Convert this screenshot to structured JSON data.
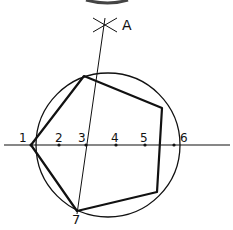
{
  "diagram": {
    "circle": {
      "cx": 108,
      "cy": 145,
      "r": 72
    },
    "baseline": {
      "x1": 4,
      "y1": 145,
      "x2": 230,
      "y2": 145
    },
    "construction_line": {
      "x1": 105,
      "y1": 18,
      "x2": 77,
      "y2": 214
    },
    "arc_mark_A": {
      "x": 105,
      "y": 25
    },
    "pentagon_vertices": [
      [
        31,
        145
      ],
      [
        84,
        76
      ],
      [
        162,
        108
      ],
      [
        157,
        192
      ],
      [
        77,
        211
      ]
    ],
    "division_points": [
      {
        "label": "1",
        "x": 31,
        "y": 145,
        "lx": 19,
        "ly": 132
      },
      {
        "label": "2",
        "x": 59,
        "y": 145,
        "lx": 55,
        "ly": 132
      },
      {
        "label": "3",
        "x": 86,
        "y": 145,
        "lx": 78,
        "ly": 132
      },
      {
        "label": "4",
        "x": 116,
        "y": 145,
        "lx": 111,
        "ly": 132
      },
      {
        "label": "5",
        "x": 145,
        "y": 145,
        "lx": 140,
        "ly": 132
      },
      {
        "label": "6",
        "x": 174,
        "y": 145,
        "lx": 180,
        "ly": 132
      }
    ],
    "labels": {
      "A": "A",
      "seven": "7"
    },
    "colors": {
      "ink": "#111111",
      "background": "#ffffff"
    }
  }
}
